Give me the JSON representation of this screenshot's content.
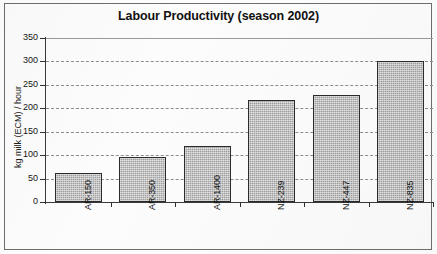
{
  "chart_data": {
    "type": "bar",
    "title": "Labour Productivity (season 2002)",
    "xlabel": "",
    "ylabel": "kg milk (ECM) / hour",
    "categories": [
      "AR-150",
      "AR-350",
      "AR-1400",
      "NZ-239",
      "NZ-447",
      "NZ-835"
    ],
    "values": [
      62,
      96,
      120,
      218,
      228,
      301
    ],
    "ylim": [
      0,
      350
    ],
    "yticks": [
      0,
      50,
      100,
      150,
      200,
      250,
      300,
      350
    ],
    "ytick_labels": [
      "0",
      "50",
      "100",
      "150",
      "200",
      "250",
      "300",
      "350"
    ],
    "grid": true,
    "grid_style": "dashed-horizontal",
    "legend": null,
    "bar_fill_color": "#b4b4b4",
    "bar_edge_color": "#2b2b2b",
    "axis_color": "#3a3a3a",
    "grid_color": "#8d8d8d",
    "background_color": "#fcfcfc"
  }
}
